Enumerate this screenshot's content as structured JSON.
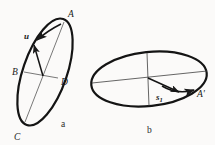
{
  "figure": {
    "background_color": "#fbfaf9",
    "ink_color": "#1a1a1a",
    "thin_line_color": "#3a3a3a",
    "panels": [
      {
        "id": "a",
        "caption": "a",
        "caption_x": 62,
        "caption_y": 124,
        "description": "Steeply inclined ellipse with major axis endpoints A and C and minor axis endpoints B and D, a velocity vector u and a curved arrow near A",
        "ellipse": {
          "center_x": 45,
          "center_y": 70,
          "radius_major": 62,
          "radius_minor": 22,
          "rotation_deg": 71
        },
        "points": [
          {
            "label": "A",
            "x": 68,
            "y": 14,
            "point_x": 64,
            "point_y": 22
          },
          {
            "label": "B",
            "x": 14,
            "y": 70,
            "point_x": 24,
            "point_y": 73
          },
          {
            "label": "C",
            "x": 14,
            "y": 134,
            "point_x": 24,
            "point_y": 122
          },
          {
            "label": "D",
            "x": 62,
            "y": 80,
            "point_x": 57,
            "point_y": 78
          }
        ],
        "vectors": [
          {
            "label": "u",
            "label_x": 27,
            "label_y": 36,
            "from_x": 42,
            "from_y": 75,
            "to_x": 33,
            "to_y": 44,
            "style": "straight-arrow"
          },
          {
            "label": "",
            "from_x": 59,
            "from_y": 24,
            "to_x": 36,
            "to_y": 40,
            "style": "curved-arrow"
          }
        ]
      },
      {
        "id": "b",
        "caption": "b",
        "caption_x": 148,
        "caption_y": 130,
        "description": "Shallow ellipse seen nearly edge-on with horizontal and vertical axis lines and a vector s1 pointing to point A prime",
        "ellipse": {
          "center_x": 149,
          "center_y": 79,
          "radius_major": 58,
          "radius_minor": 27,
          "rotation_deg": -8
        },
        "points": [
          {
            "label": "A'",
            "x": 200,
            "y": 94,
            "point_x": 194,
            "point_y": 91
          }
        ],
        "vectors": [
          {
            "label": "s",
            "subscript": "1",
            "label_x": 158,
            "label_y": 97,
            "from_x": 149,
            "from_y": 79,
            "to_x": 180,
            "to_y": 92,
            "style": "straight-arrow"
          },
          {
            "label": "",
            "from_x": 166,
            "from_y": 87,
            "to_x": 196,
            "to_y": 90,
            "style": "curved-arrow"
          }
        ],
        "axes": [
          {
            "name": "horizontal-axis",
            "x1": 92,
            "y1": 82,
            "x2": 207,
            "y2": 76
          },
          {
            "name": "vertical-axis",
            "x1": 147,
            "y1": 52,
            "x2": 149,
            "y2": 106
          }
        ]
      }
    ]
  }
}
